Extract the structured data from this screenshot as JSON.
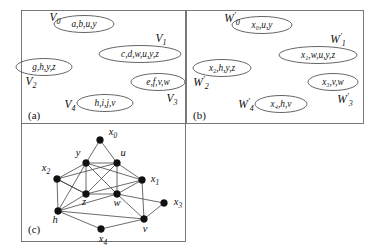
{
  "figure": {
    "title_caption": "",
    "panels": [
      {
        "id": "a",
        "tag": "(a)",
        "name": "panel-a-hypergraph-V",
        "sets": [
          {
            "label_base": "V",
            "label_sub": "0",
            "members": "a,b,u,y"
          },
          {
            "label_base": "V",
            "label_sub": "1",
            "members": "c,d,w,u,y,z"
          },
          {
            "label_base": "V",
            "label_sub": "2",
            "members": "g,h,y,z"
          },
          {
            "label_base": "V",
            "label_sub": "3",
            "members": "e,f,v,w"
          },
          {
            "label_base": "V",
            "label_sub": "4",
            "members": "h,i,j,v"
          }
        ]
      },
      {
        "id": "b",
        "tag": "(b)",
        "name": "panel-b-hypergraph-W",
        "sets": [
          {
            "label_base": "W",
            "label_sub": "0",
            "label_prime": "'",
            "members": "x0,u,y",
            "members_display": "x₀,u,y"
          },
          {
            "label_base": "W",
            "label_sub": "1",
            "label_prime": "'",
            "members": "x1,w,u,y,z",
            "members_display": "x₁,w,u,y,z"
          },
          {
            "label_base": "W",
            "label_sub": "2",
            "label_prime": "'",
            "members": "x2,h,y,z",
            "members_display": "x₂,h,y,z"
          },
          {
            "label_base": "W",
            "label_sub": "3",
            "label_prime": "'",
            "members": "x3,v,w",
            "members_display": "x₃,v,w"
          },
          {
            "label_base": "W",
            "label_sub": "4",
            "label_prime": "'",
            "members": "x4,h,v",
            "members_display": "x₄,h,v"
          }
        ]
      },
      {
        "id": "c",
        "tag": "(c)",
        "name": "panel-c-graph",
        "nodes": [
          {
            "id": "x0",
            "base": "x",
            "sub": "0",
            "x": 100,
            "y": 140
          },
          {
            "id": "y",
            "base": "y",
            "sub": "",
            "x": 86,
            "y": 163
          },
          {
            "id": "u",
            "base": "u",
            "sub": "",
            "x": 117,
            "y": 163
          },
          {
            "id": "x2",
            "base": "x",
            "sub": "2",
            "x": 57,
            "y": 179
          },
          {
            "id": "x1",
            "base": "x",
            "sub": "1",
            "x": 142,
            "y": 180
          },
          {
            "id": "z",
            "base": "z",
            "sub": "",
            "x": 86,
            "y": 194
          },
          {
            "id": "w",
            "base": "w",
            "sub": "",
            "x": 117,
            "y": 194
          },
          {
            "id": "x3",
            "base": "x",
            "sub": "3",
            "x": 164,
            "y": 203
          },
          {
            "id": "h",
            "base": "h",
            "sub": "",
            "x": 58,
            "y": 211
          },
          {
            "id": "v",
            "base": "v",
            "sub": "",
            "x": 144,
            "y": 219
          },
          {
            "id": "x4",
            "base": "x",
            "sub": "4",
            "x": 101,
            "y": 229
          }
        ],
        "edges": [
          [
            "x0",
            "y"
          ],
          [
            "x0",
            "u"
          ],
          [
            "y",
            "u"
          ],
          [
            "y",
            "z"
          ],
          [
            "y",
            "w"
          ],
          [
            "y",
            "x1"
          ],
          [
            "y",
            "x2"
          ],
          [
            "y",
            "h"
          ],
          [
            "u",
            "z"
          ],
          [
            "u",
            "w"
          ],
          [
            "u",
            "x1"
          ],
          [
            "u",
            "x2"
          ],
          [
            "z",
            "w"
          ],
          [
            "z",
            "x1"
          ],
          [
            "z",
            "x2"
          ],
          [
            "z",
            "h"
          ],
          [
            "w",
            "x1"
          ],
          [
            "w",
            "x3"
          ],
          [
            "w",
            "v"
          ],
          [
            "w",
            "h"
          ],
          [
            "x2",
            "z"
          ],
          [
            "x2",
            "h"
          ],
          [
            "x1",
            "v"
          ],
          [
            "x3",
            "v"
          ],
          [
            "h",
            "x4"
          ],
          [
            "h",
            "v"
          ],
          [
            "x4",
            "v"
          ]
        ]
      }
    ]
  },
  "colors": {
    "stroke": "#3a3a3a",
    "node": "#111111",
    "panel_border": "#6b6b6b",
    "background": "#ffffff"
  }
}
